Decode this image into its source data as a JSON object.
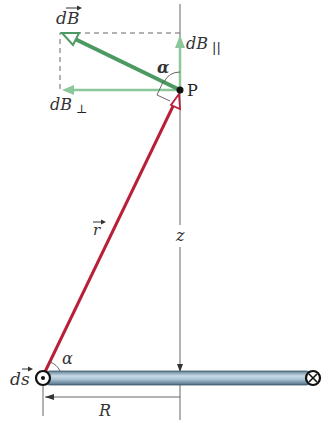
{
  "diagram": {
    "labels": {
      "dB": "dB",
      "dB_parallel": "dB",
      "dB_parallel_sub": "||",
      "dB_perp": "dB",
      "dB_perp_sub": "⊥",
      "alpha_top": "α",
      "alpha_bottom": "α",
      "point": "P",
      "r": "r",
      "z": "z",
      "ds": "ds",
      "R": "R"
    },
    "symbols": {
      "current_out": "dot-in-circle",
      "current_in": "cross-in-circle"
    },
    "colors": {
      "green_vector": "#4c9a62",
      "green_light": "#8cc79c",
      "red_vector": "#b8203a",
      "rod": "#8fb0c6",
      "axis": "#555555",
      "dashed": "#666666"
    }
  }
}
